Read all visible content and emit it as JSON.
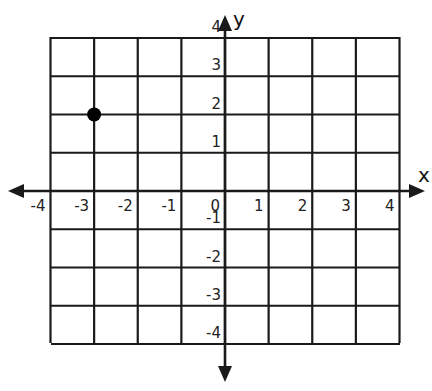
{
  "chart_data": {
    "type": "scatter",
    "title": "",
    "xlabel": "x",
    "ylabel": "y",
    "xlim": [
      -4,
      4
    ],
    "ylim": [
      -4,
      4
    ],
    "grid": true,
    "x_ticks": [
      "-4",
      "-3",
      "-2",
      "-1",
      "0",
      "1",
      "2",
      "3",
      "4"
    ],
    "y_ticks": [
      "4",
      "3",
      "2",
      "1",
      "-1",
      "-2",
      "-3",
      "-4"
    ],
    "points": [
      {
        "x": -3,
        "y": 2
      }
    ]
  },
  "colors": {
    "line": "#1a1a1a",
    "point": "#000000",
    "background": "#ffffff"
  }
}
